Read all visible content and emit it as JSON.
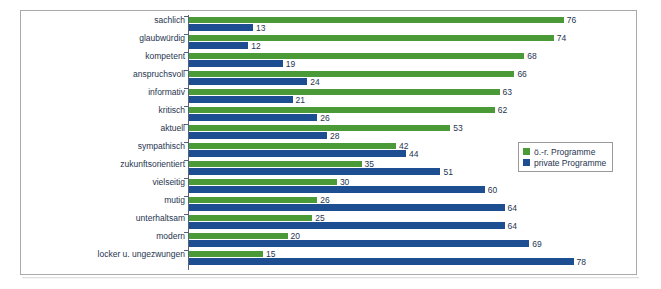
{
  "title_strip": "",
  "legend": {
    "position": "inside-right",
    "items": [
      {
        "label": "ö.-r. Programme",
        "color": "#4a9b38",
        "swatch": "green-swatch"
      },
      {
        "label": "private Programme",
        "color": "#1d4e91",
        "swatch": "blue-swatch"
      }
    ]
  },
  "chart_data": {
    "type": "bar",
    "orientation": "horizontal",
    "title": "",
    "subtitle": "",
    "xlabel": "",
    "ylabel": "",
    "xlim": [
      0,
      80
    ],
    "grid": false,
    "legend_position": "inside-right",
    "colors": {
      "series_1": "#4a9b38",
      "series_2": "#1d4e91",
      "text": "#26354f",
      "frame": "#a9a9a9"
    },
    "categories": [
      "sachlich",
      "glaubwürdig",
      "kompetent",
      "anspruchsvoll",
      "informativ",
      "kritisch",
      "aktuell",
      "sympathisch",
      "zukunftsorientiert",
      "vielseitig",
      "mutig",
      "unterhaltsam",
      "modern",
      "locker u. ungezwungen"
    ],
    "series": [
      {
        "name": "ö.-r. Programme",
        "color": "#4a9b38",
        "values": [
          76,
          74,
          68,
          66,
          63,
          62,
          53,
          42,
          35,
          30,
          26,
          25,
          20,
          15
        ]
      },
      {
        "name": "private Programme",
        "color": "#1d4e91",
        "values": [
          13,
          12,
          19,
          24,
          21,
          26,
          28,
          44,
          51,
          60,
          64,
          64,
          69,
          78
        ]
      }
    ]
  }
}
